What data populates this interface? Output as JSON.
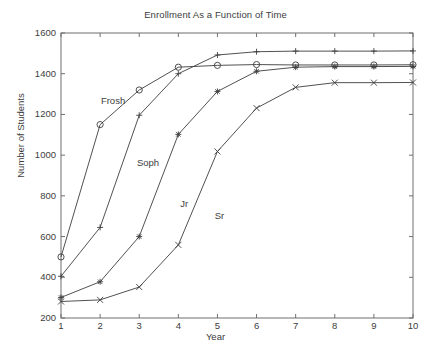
{
  "chart_data": {
    "type": "line",
    "title": "Enrollment As a Function of Time",
    "xlabel": "Year",
    "ylabel": "Number of Students",
    "x": [
      1,
      2,
      3,
      4,
      5,
      6,
      7,
      8,
      9,
      10
    ],
    "xlim": [
      1,
      10
    ],
    "ylim": [
      200,
      1600
    ],
    "xticks": [
      "1",
      "2",
      "3",
      "4",
      "5",
      "6",
      "7",
      "8",
      "9",
      "10"
    ],
    "yticks": [
      "200",
      "400",
      "600",
      "800",
      "1000",
      "1200",
      "1400",
      "1600"
    ],
    "grid": false,
    "legend": "inline-labels",
    "series": [
      {
        "name": "Frosh",
        "marker": "circle",
        "color": "#3d3d3d",
        "label_x": 2.02,
        "label_y": 1268,
        "values": [
          500,
          1150,
          1320,
          1432,
          1441,
          1445,
          1443,
          1443,
          1443,
          1444
        ]
      },
      {
        "name": "Soph",
        "marker": "plus",
        "color": "#3d3d3d",
        "label_x": 2.94,
        "label_y": 960,
        "values": [
          405,
          645,
          1196,
          1400,
          1492,
          1508,
          1511,
          1511,
          1511,
          1512
        ]
      },
      {
        "name": "Jr",
        "marker": "asterisk",
        "color": "#3d3d3d",
        "label_x": 4.05,
        "label_y": 760,
        "values": [
          301,
          378,
          600,
          1102,
          1313,
          1412,
          1432,
          1435,
          1435,
          1436
        ]
      },
      {
        "name": "Sr",
        "marker": "cross",
        "color": "#3d3d3d",
        "label_x": 4.93,
        "label_y": 700,
        "values": [
          281,
          289,
          352,
          559,
          1018,
          1231,
          1333,
          1356,
          1356,
          1357
        ]
      }
    ]
  }
}
